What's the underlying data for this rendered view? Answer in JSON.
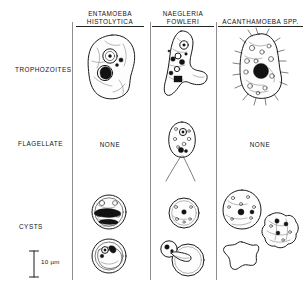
{
  "figure": {
    "background_color": "#ffffff",
    "ink_color": "#1b1b1b",
    "divider_color": "#8e8e8e"
  },
  "columns": [
    {
      "id": "entamoeba",
      "line1": "ENTAMOEBA",
      "line2": "HISTOLYTICA",
      "two_line": true
    },
    {
      "id": "naegleria",
      "line1": "NAEGLERIA",
      "line2": "FOWLERI",
      "two_line": true
    },
    {
      "id": "acanthamoeba",
      "line1": "ACANTHAMOEBA SPP.",
      "line2": "",
      "two_line": false
    }
  ],
  "rows": [
    {
      "id": "trophozoites",
      "label": "TROPHOZOITES"
    },
    {
      "id": "flagellate",
      "label": "FLAGELLATE"
    },
    {
      "id": "cysts",
      "label": "CYSTS"
    }
  ],
  "cells": {
    "trophozoites": {
      "entamoeba": {
        "type": "drawing",
        "description": "irregular ovoid amoeba with pseudopod, one ring nucleus with karyosome, one dark ingested erythrocyte, two small chromatin granules"
      },
      "naegleria": {
        "type": "drawing",
        "description": "elongated limax amoeba with blunt lobopodium, nucleus with karyosome, dark food vacuoles"
      },
      "acanthamoeba": {
        "type": "drawing",
        "description": "amoeba with spiny acanthopodia, many vacuoles, large dark nucleus"
      }
    },
    "flagellate": {
      "entamoeba": {
        "type": "text",
        "text": "NONE"
      },
      "naegleria": {
        "type": "drawing",
        "description": "pear-shaped flagellate with two long flagella and nucleus"
      },
      "acanthamoeba": {
        "type": "text",
        "text": "NONE"
      }
    },
    "cysts": {
      "entamoeba": {
        "type": "drawing",
        "count": 2,
        "description": "upper cyst with blunt chromatoid bars; lower cyst with nuclei and crescent body"
      },
      "naegleria": {
        "type": "drawing",
        "count": 2,
        "description": "upper round smooth cyst with nucleus; lower cyst with excysting amoeba emerging through pore"
      },
      "acanthamoeba": {
        "type": "drawing",
        "count": 3,
        "description": "round double-walled cyst with nuclei; wrinkled cyst with nuclei; stellate (star-shaped) cyst wall"
      }
    }
  },
  "scale_bar": {
    "label": "10 µm",
    "value": 10,
    "unit": "µm",
    "orientation": "vertical"
  }
}
